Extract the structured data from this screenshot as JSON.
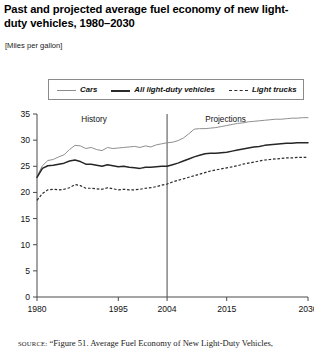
{
  "title": "Past and projected average fuel economy of new light-duty vehicles, 1980–2030",
  "subtitle": "[Miles per gallon]",
  "legend": {
    "entries": [
      {
        "label": "Cars",
        "style": "thin-solid",
        "color": "#8f8f8f"
      },
      {
        "label": "All light-duty vehicles",
        "style": "thick-solid",
        "color": "#262626"
      },
      {
        "label": "Light trucks",
        "style": "dashed",
        "color": "#2b2b2b"
      }
    ]
  },
  "annotations": {
    "history": "History",
    "projections": "Projections",
    "divider_year": 2004
  },
  "source": {
    "label": "SOURCE:",
    "text": "“Figure 51. Average Fuel Economy of New Light-Duty Vehicles,"
  },
  "chart_data": {
    "type": "line",
    "title": "Past and projected average fuel economy of new light-duty vehicles, 1980–2030",
    "xlabel": "",
    "ylabel": "Miles per gallon",
    "xlim": [
      1980,
      2030
    ],
    "ylim": [
      0,
      35
    ],
    "yticks": [
      0,
      5,
      10,
      15,
      20,
      25,
      30,
      35
    ],
    "xticks": [
      1980,
      1995,
      2004,
      2015,
      2030
    ],
    "xtick_labels": [
      "1980",
      "1995",
      "2004",
      "2015",
      "2030"
    ],
    "ytick_labels": [
      "0",
      "5",
      "10",
      "15",
      "20",
      "25",
      "30",
      "35"
    ],
    "grid": false,
    "legend_position": "above-plot",
    "divider_year": 2004,
    "divider_labels": {
      "left": "History",
      "right": "Projections"
    },
    "x": [
      1980,
      1981,
      1982,
      1983,
      1984,
      1985,
      1986,
      1987,
      1988,
      1989,
      1990,
      1991,
      1992,
      1993,
      1994,
      1995,
      1996,
      1997,
      1998,
      1999,
      2000,
      2001,
      2002,
      2003,
      2004,
      2005,
      2006,
      2007,
      2008,
      2009,
      2010,
      2011,
      2012,
      2013,
      2014,
      2015,
      2016,
      2017,
      2018,
      2019,
      2020,
      2021,
      2022,
      2023,
      2024,
      2025,
      2026,
      2027,
      2028,
      2029,
      2030
    ],
    "series": [
      {
        "name": "Cars",
        "values": [
          23.1,
          25.1,
          26.1,
          26.3,
          26.8,
          27.2,
          28.2,
          29.0,
          28.9,
          28.4,
          28.6,
          28.2,
          28.0,
          28.6,
          28.4,
          28.5,
          28.6,
          28.7,
          28.8,
          28.6,
          28.9,
          28.7,
          29.1,
          29.3,
          29.5,
          29.6,
          29.9,
          30.4,
          31.2,
          32.1,
          32.2,
          32.2,
          32.3,
          32.4,
          32.6,
          32.8,
          33.0,
          33.2,
          33.3,
          33.5,
          33.6,
          33.7,
          33.8,
          33.9,
          34.0,
          34.0,
          34.1,
          34.2,
          34.2,
          34.3,
          34.3
        ]
      },
      {
        "name": "All light-duty vehicles",
        "values": [
          22.9,
          24.6,
          25.1,
          25.2,
          25.4,
          25.6,
          26.0,
          26.2,
          25.9,
          25.4,
          25.4,
          25.2,
          25.0,
          25.3,
          25.1,
          24.9,
          25.0,
          24.8,
          24.7,
          24.6,
          24.8,
          24.8,
          24.9,
          25.0,
          25.0,
          25.3,
          25.6,
          26.0,
          26.4,
          26.8,
          27.1,
          27.4,
          27.5,
          27.5,
          27.6,
          27.7,
          27.9,
          28.1,
          28.3,
          28.5,
          28.7,
          28.8,
          29.0,
          29.1,
          29.2,
          29.3,
          29.4,
          29.4,
          29.5,
          29.5,
          29.5
        ]
      },
      {
        "name": "Light trucks",
        "values": [
          18.5,
          19.8,
          20.5,
          20.6,
          20.5,
          20.6,
          20.9,
          21.5,
          21.3,
          20.8,
          20.8,
          20.7,
          20.6,
          20.9,
          20.7,
          20.5,
          20.6,
          20.5,
          20.5,
          20.6,
          20.8,
          20.9,
          21.1,
          21.4,
          21.6,
          22.0,
          22.3,
          22.6,
          22.9,
          23.2,
          23.5,
          23.8,
          24.1,
          24.3,
          24.5,
          24.7,
          24.9,
          25.1,
          25.4,
          25.6,
          25.8,
          26.0,
          26.2,
          26.3,
          26.4,
          26.5,
          26.6,
          26.6,
          26.7,
          26.7,
          26.7
        ]
      }
    ]
  }
}
